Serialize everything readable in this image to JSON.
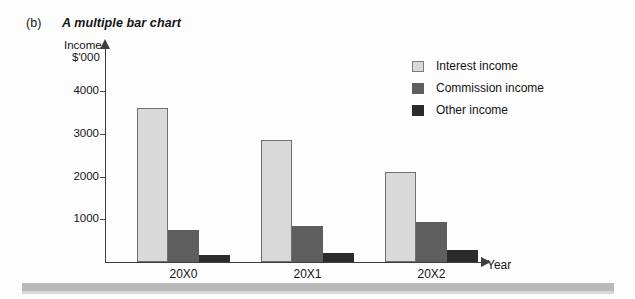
{
  "figure": {
    "label": "(b)",
    "title": "A multiple bar chart"
  },
  "chart_data": {
    "type": "bar",
    "title": "A multiple bar chart",
    "xlabel": "Year",
    "ylabel": "Income $'000",
    "ylabel_line1": "Income",
    "ylabel_line2": "$'000",
    "categories": [
      "20X0",
      "20X1",
      "20X2"
    ],
    "series": [
      {
        "name": "Interest income",
        "color": "#d9d9d9",
        "values": [
          3600,
          2850,
          2120
        ]
      },
      {
        "name": "Commission income",
        "color": "#5e5e5e",
        "values": [
          750,
          840,
          930
        ]
      },
      {
        "name": "Other income",
        "color": "#2b2b2b",
        "values": [
          170,
          200,
          280
        ]
      }
    ],
    "ylim": [
      0,
      4400
    ],
    "yticks": [
      1000,
      2000,
      3000,
      4000
    ],
    "ytick_labels": [
      "1000",
      "2000",
      "3000",
      "4000"
    ],
    "grid": false,
    "legend_position": "top-right"
  },
  "axis": {
    "x_title": "Year"
  }
}
